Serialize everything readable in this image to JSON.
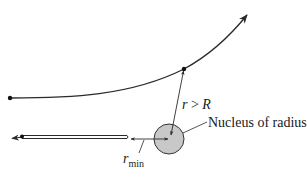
{
  "diagram": {
    "labels": {
      "distance_condition": "r > R",
      "distance_condition_var": "r",
      "distance_condition_op": ">",
      "distance_condition_rhs": "R",
      "nucleus": "Nucleus of radius R",
      "nucleus_text": "Nucleus of radius ",
      "nucleus_var": "R",
      "rmin_var": "r",
      "rmin_sub": "min"
    },
    "elements": {
      "scattered_trajectory": "curved path deflected upward with arrowhead",
      "backscattered_trajectory": "head-on path reflected back (double line) with left arrowhead",
      "nucleus": "gray filled circle",
      "r_arrow": "double-headed arrow from nucleus center to particle",
      "rmin_arrow": "double-headed arrow from turning point to nucleus center"
    },
    "colors": {
      "line": "#2a2a2a",
      "nucleus_fill": "#c8c8c8",
      "nucleus_stroke": "#333333",
      "background": "#ffffff"
    }
  }
}
